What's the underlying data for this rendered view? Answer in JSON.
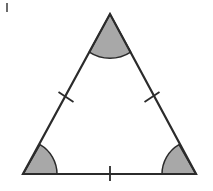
{
  "figure": {
    "caption": "Triangle diagram",
    "background_color": "#ffffff",
    "stroke_color": "#2b2b2b",
    "angle_fill_color": "#a8a8a8",
    "angle_fill_opacity": "1",
    "stroke_width_px": "2.2",
    "canvas": {
      "width": 213,
      "height": 191
    }
  },
  "artifact": {
    "name": "scan-speck",
    "label": "",
    "x": 6,
    "y": 3,
    "width": 2,
    "height": 9,
    "color": "#3a3a3a",
    "opacity": "0.75"
  },
  "triangle": {
    "name": "equilateral-triangle",
    "vertices": [
      {
        "id": "apex",
        "label": "top vertex",
        "x": 110,
        "y": 14
      },
      {
        "id": "bottom-left",
        "label": "bottom left vertex",
        "x": 23,
        "y": 174
      },
      {
        "id": "bottom-right",
        "label": "bottom right vertex",
        "x": 196,
        "y": 174
      }
    ],
    "points_attr": "110,14 23,174 196,174",
    "fill": "none"
  },
  "angle_arcs": [
    {
      "id": "apex-angle",
      "label": "top shaded angle",
      "vertex_x": 110,
      "vertex_y": 14,
      "radius": 38,
      "path": "M 110 14 L 89.3 52.1 A 38 38 0 0 0 130.7 52.1 Z"
    },
    {
      "id": "bottom-left-angle",
      "label": "bottom left shaded angle",
      "vertex_x": 23,
      "vertex_y": 174,
      "radius": 34,
      "path": "M 23 174 L 57 174 A 34 34 0 0 0 40 144.6 Z"
    },
    {
      "id": "bottom-right-angle",
      "label": "bottom right shaded angle",
      "vertex_x": 196,
      "vertex_y": 174,
      "radius": 34,
      "path": "M 196 174 L 179 144.6 A 34 34 0 0 0 162 174 Z"
    }
  ],
  "tick_marks": [
    {
      "id": "left-side-tick",
      "label": "congruence tick on left side",
      "x1": 58.5,
      "y1": 92.0,
      "x2": 73.5,
      "y2": 102.0
    },
    {
      "id": "right-side-tick",
      "label": "congruence tick on right side",
      "x1": 144.5,
      "y1": 102.0,
      "x2": 159.5,
      "y2": 92.0
    },
    {
      "id": "base-tick",
      "label": "congruence tick on base",
      "x1": 110,
      "y1": 166,
      "x2": 110,
      "y2": 181
    }
  ]
}
